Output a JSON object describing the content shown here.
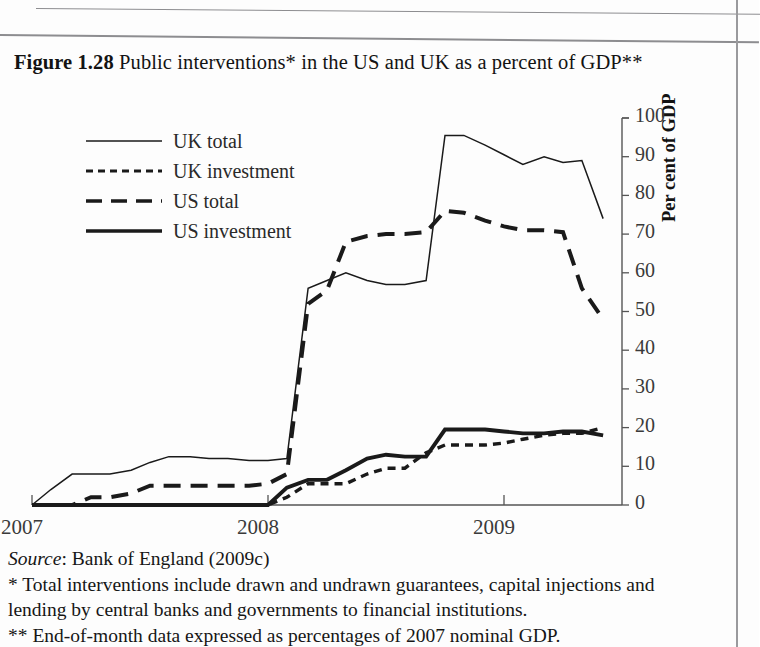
{
  "figure": {
    "number": "Figure 1.28",
    "title": "Public interventions* in the US and UK as a percent of GDP**"
  },
  "notes": {
    "source_word": "Source",
    "source_rest": ": Bank of England (2009c)",
    "note1_line1": "* Total interventions include drawn and undrawn guarantees, capital injections and",
    "note1_line2": "lending by central banks and governments to financial institutions.",
    "note2": "** End-of-month data expressed as percentages of 2007 nominal GDP."
  },
  "chart_data": {
    "type": "line",
    "title": "Public interventions* in the US and UK as a percent of GDP**",
    "xlabel": "",
    "ylabel": "Per cent of GDP",
    "ylim": [
      0,
      100
    ],
    "ytick_values": [
      0,
      10,
      20,
      30,
      40,
      50,
      60,
      70,
      80,
      90,
      100
    ],
    "ytick_labels": [
      "0",
      "10",
      "20",
      "30",
      "40",
      "50",
      "60",
      "70",
      "80",
      "90",
      "100"
    ],
    "xlim": [
      2007.0,
      2009.5
    ],
    "xtick_values": [
      2007,
      2008,
      2009
    ],
    "xtick_labels": [
      "2007",
      "2008",
      "2009"
    ],
    "grid": false,
    "legend_position": "upper-left",
    "x": [
      2007.0,
      2007.08,
      2007.17,
      2007.25,
      2007.33,
      2007.42,
      2007.5,
      2007.58,
      2007.67,
      2007.75,
      2007.83,
      2007.92,
      2008.0,
      2008.08,
      2008.17,
      2008.25,
      2008.33,
      2008.42,
      2008.5,
      2008.58,
      2008.67,
      2008.75,
      2008.83,
      2008.92,
      2009.0,
      2009.08,
      2009.17,
      2009.25,
      2009.33,
      2009.42
    ],
    "series": [
      {
        "name": "UK total",
        "style": "thin-solid",
        "values": [
          0,
          4,
          8,
          8,
          8,
          9,
          11,
          12.5,
          12.5,
          12,
          12,
          11.5,
          11.5,
          12,
          56,
          58,
          60,
          58,
          57,
          57,
          58,
          95.5,
          95.5,
          93,
          90.5,
          88,
          90,
          88.5,
          89,
          74
        ]
      },
      {
        "name": "UK investment",
        "style": "fine-dashed",
        "values": [
          0,
          0,
          0,
          0,
          0,
          0,
          0,
          0,
          0,
          0,
          0,
          0,
          0,
          2,
          5.5,
          5.5,
          5.5,
          8,
          9.5,
          9.5,
          13.5,
          15.5,
          15.5,
          15.5,
          16,
          17,
          18,
          18.5,
          18.5,
          20
        ]
      },
      {
        "name": "US total",
        "style": "long-dashed",
        "values": [
          0,
          0,
          0,
          2,
          2,
          3,
          5,
          5,
          5,
          5,
          5,
          5,
          5.5,
          8,
          52,
          55.5,
          68,
          69.5,
          70,
          70,
          70.5,
          76,
          75.5,
          73.5,
          72,
          71,
          71,
          70.5,
          56,
          48
        ]
      },
      {
        "name": "US investment",
        "style": "thick-solid",
        "values": [
          0,
          0,
          0,
          0,
          0,
          0,
          0,
          0,
          0,
          0,
          0,
          0,
          0,
          4.5,
          6.5,
          6.5,
          9,
          12,
          13,
          12.5,
          12.5,
          19.5,
          19.5,
          19.5,
          19,
          18.5,
          18.5,
          19,
          19,
          18
        ]
      }
    ]
  }
}
